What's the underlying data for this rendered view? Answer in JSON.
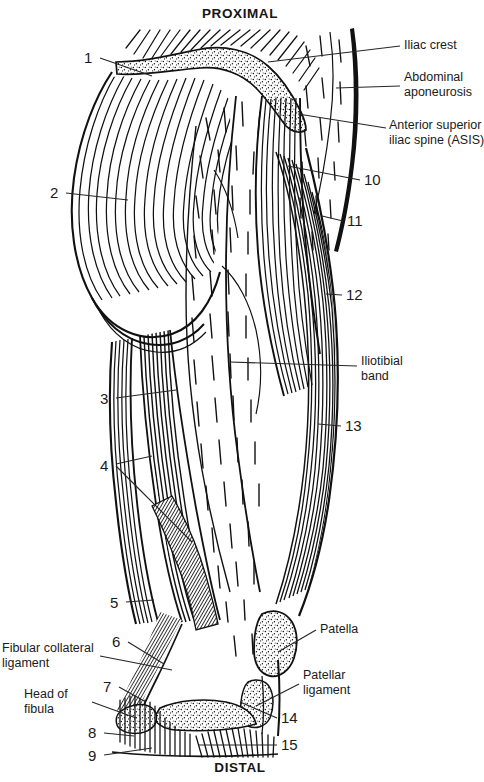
{
  "figure": {
    "title_top": "PROXIMAL",
    "title_bottom": "DISTAL"
  },
  "orientation": {
    "proximal": "PROXIMAL",
    "distal": "DISTAL"
  },
  "numbered_labels": [
    {
      "id": "1",
      "text": "1",
      "x": 84,
      "y": 50,
      "side": "left"
    },
    {
      "id": "2",
      "text": "2",
      "x": 50,
      "y": 185,
      "side": "left"
    },
    {
      "id": "3",
      "text": "3",
      "x": 100,
      "y": 391,
      "side": "left"
    },
    {
      "id": "4",
      "text": "4",
      "x": 100,
      "y": 458,
      "side": "left"
    },
    {
      "id": "5",
      "text": "5",
      "x": 110,
      "y": 595,
      "side": "left"
    },
    {
      "id": "6",
      "text": "6",
      "x": 112,
      "y": 634,
      "side": "left"
    },
    {
      "id": "7",
      "text": "7",
      "x": 103,
      "y": 679,
      "side": "left"
    },
    {
      "id": "8",
      "text": "8",
      "x": 88,
      "y": 725,
      "side": "left"
    },
    {
      "id": "9",
      "text": "9",
      "x": 88,
      "y": 748,
      "side": "left"
    },
    {
      "id": "10",
      "text": "10",
      "x": 364,
      "y": 172,
      "side": "right"
    },
    {
      "id": "11",
      "text": "11",
      "x": 347,
      "y": 213,
      "side": "right"
    },
    {
      "id": "12",
      "text": "12",
      "x": 346,
      "y": 287,
      "side": "right"
    },
    {
      "id": "13",
      "text": "13",
      "x": 345,
      "y": 418,
      "side": "right"
    },
    {
      "id": "14",
      "text": "14",
      "x": 281,
      "y": 710,
      "side": "right"
    },
    {
      "id": "15",
      "text": "15",
      "x": 281,
      "y": 737,
      "side": "right"
    }
  ],
  "named_labels": [
    {
      "id": "iliac-crest",
      "lines": [
        "Iliac crest"
      ],
      "x": 404,
      "y": 38,
      "align": "left"
    },
    {
      "id": "abdominal-aponeurosis",
      "lines": [
        "Abdominal",
        "aponeurosis"
      ],
      "x": 404,
      "y": 70,
      "align": "left"
    },
    {
      "id": "anterior-superior-iliac-spine",
      "lines": [
        "Anterior superior",
        "iliac spine (ASIS)"
      ],
      "x": 389,
      "y": 118,
      "align": "left"
    },
    {
      "id": "iliotibial-band",
      "lines": [
        "Iliotibial",
        "band"
      ],
      "x": 361,
      "y": 354,
      "align": "left"
    },
    {
      "id": "patella",
      "lines": [
        "Patella"
      ],
      "x": 320,
      "y": 622,
      "align": "left"
    },
    {
      "id": "patellar-ligament",
      "lines": [
        "Patellar",
        "ligament"
      ],
      "x": 303,
      "y": 668,
      "align": "left"
    },
    {
      "id": "fibular-collateral-ligament",
      "lines": [
        "Fibular collateral",
        "ligament"
      ],
      "x": 2,
      "y": 641,
      "align": "left"
    },
    {
      "id": "head-of-fibula",
      "lines": [
        "Head of",
        "fibula"
      ],
      "x": 24,
      "y": 687,
      "align": "left"
    }
  ],
  "colors": {
    "ink": "#111111",
    "text": "#1a1a1a",
    "background": "#ffffff",
    "leader": "#262626"
  }
}
